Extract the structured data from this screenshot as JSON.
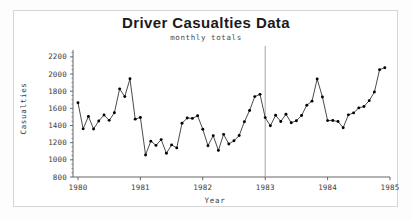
{
  "chart_data": {
    "type": "line",
    "title": "Driver  Casualties  Data",
    "subtitle": "monthly totals",
    "xlabel": "Year",
    "ylabel": "Casualties",
    "xlim": [
      1979.92,
      1985.0
    ],
    "ylim": [
      800,
      2280
    ],
    "ytick_labels": [
      "2200",
      "2000",
      "1800",
      "1600",
      "1400",
      "1200",
      "1000",
      "800"
    ],
    "yticks": [
      2200,
      2000,
      1800,
      1600,
      1400,
      1200,
      1000,
      800
    ],
    "ytick_minor_step": 50,
    "xtick_labels": [
      "1980",
      "1981",
      "1982",
      "1983",
      "1984",
      "1985"
    ],
    "xticks": [
      1980,
      1981,
      1982,
      1983,
      1984,
      1985
    ],
    "grid": false,
    "legend": null,
    "marker": "filled-circle",
    "line_color": "#2a2a2a",
    "marker_color": "#000000",
    "annotations": [
      {
        "name": "intervention-line",
        "type": "vline",
        "x": 1983.0,
        "label": "",
        "color": "#9a9a9a"
      }
    ],
    "x": [
      1980.0,
      1980.083,
      1980.167,
      1980.25,
      1980.333,
      1980.417,
      1980.5,
      1980.583,
      1980.667,
      1980.75,
      1980.833,
      1980.917,
      1981.0,
      1981.083,
      1981.167,
      1981.25,
      1981.333,
      1981.417,
      1981.5,
      1981.583,
      1981.667,
      1981.75,
      1981.833,
      1981.917,
      1982.0,
      1982.083,
      1982.167,
      1982.25,
      1982.333,
      1982.417,
      1982.5,
      1982.583,
      1982.667,
      1982.75,
      1982.833,
      1982.917,
      1983.0,
      1983.083,
      1983.167,
      1983.25,
      1983.333,
      1983.417,
      1983.5,
      1983.583,
      1983.667,
      1983.75,
      1983.833,
      1983.917,
      1984.0,
      1984.083,
      1984.167,
      1984.25,
      1984.333,
      1984.417,
      1984.5,
      1984.583,
      1984.667,
      1984.75,
      1984.833,
      1984.917
    ],
    "values": [
      1665,
      1361,
      1506,
      1360,
      1453,
      1522,
      1460,
      1548,
      1827,
      1737,
      1945,
      1474,
      1494,
      1057,
      1218,
      1168,
      1236,
      1076,
      1174,
      1139,
      1427,
      1487,
      1483,
      1513,
      1357,
      1165,
      1282,
      1110,
      1297,
      1185,
      1222,
      1284,
      1444,
      1575,
      1737,
      1763,
      1492,
      1397,
      1519,
      1447,
      1531,
      1432,
      1456,
      1517,
      1637,
      1684,
      1942,
      1733,
      1457,
      1458,
      1447,
      1374,
      1524,
      1547,
      1605,
      1622,
      1690,
      1790,
      2050,
      2074
    ],
    "series_name": "Monthly driver casualties"
  }
}
